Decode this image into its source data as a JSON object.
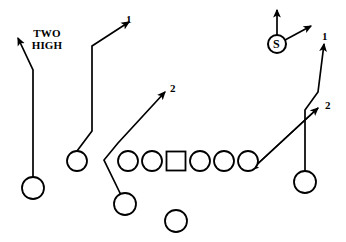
{
  "diagram": {
    "width": 346,
    "height": 242,
    "background_color": "#ffffff",
    "stroke_color": "#000000"
  },
  "labels": {
    "coverage": {
      "line1": "TWO",
      "line2": "HIGH",
      "x": 41,
      "y": 33
    }
  },
  "defenders": [
    {
      "name": "safety",
      "letter": "S",
      "x": 277,
      "y": 44,
      "radius": 9,
      "drops": [
        {
          "name": "safety-vertical-drop",
          "label": ""
        },
        {
          "name": "safety-diagonal-drop",
          "label": ""
        }
      ]
    }
  ],
  "offense": {
    "line": [
      {
        "name": "lineman-left-end",
        "shape": "circle",
        "x": 128,
        "y": 161,
        "radius": 10
      },
      {
        "name": "lineman-left-tackle",
        "shape": "circle",
        "x": 152,
        "y": 161,
        "radius": 10
      },
      {
        "name": "center",
        "shape": "square",
        "x": 176,
        "y": 161,
        "size": 19
      },
      {
        "name": "lineman-right-tackle",
        "shape": "circle",
        "x": 200,
        "y": 161,
        "radius": 10
      },
      {
        "name": "lineman-right-guard",
        "shape": "circle",
        "x": 224,
        "y": 161,
        "radius": 10
      },
      {
        "name": "lineman-right-end",
        "shape": "circle",
        "x": 248,
        "y": 161,
        "radius": 10
      }
    ],
    "receivers": [
      {
        "name": "receiver-split-left",
        "x": 33,
        "y": 188,
        "radius": 11
      },
      {
        "name": "receiver-slot-left",
        "x": 77,
        "y": 161,
        "radius": 10
      },
      {
        "name": "receiver-split-right",
        "x": 305,
        "y": 182,
        "radius": 11
      }
    ],
    "backs": [
      {
        "name": "back-near",
        "x": 125,
        "y": 204,
        "radius": 11
      },
      {
        "name": "back-far",
        "x": 176,
        "y": 221,
        "radius": 11
      }
    ]
  },
  "routes": [
    {
      "name": "route-split-left-vertical-out",
      "label": "",
      "points": "33,177 33,70 18,38"
    },
    {
      "name": "route-slot-left-seam",
      "label": "1",
      "label_x": 126,
      "label_y": 14,
      "points": "77,151 92,131 92,46 129,22"
    },
    {
      "name": "route-under-to-back",
      "label": "2",
      "label_x": 170,
      "label_y": 83,
      "points": "120,193 104,160 118,143 165,92"
    },
    {
      "name": "route-split-right-vertical",
      "label": "1",
      "label_x": 322,
      "label_y": 31,
      "points": "305,171 305,110 318,92 324,44"
    },
    {
      "name": "route-right-in-breaking",
      "label": "2",
      "label_x": 325,
      "label_y": 100,
      "points": "251,170 318,108"
    }
  ]
}
